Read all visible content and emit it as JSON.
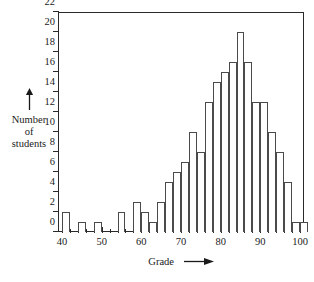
{
  "figure": {
    "y_axis": {
      "caption_lines": [
        "Number",
        "of",
        "students"
      ],
      "arrow_icon": "up-arrow-icon",
      "ticks": [
        0,
        2,
        4,
        6,
        8,
        10,
        12,
        14,
        16,
        18,
        20,
        22
      ],
      "min": 0,
      "max": 22
    },
    "x_axis": {
      "caption": "Grade",
      "arrow_icon": "right-arrow-icon",
      "ticks": [
        40,
        50,
        60,
        70,
        80,
        90,
        100
      ],
      "minor_step": 2,
      "min": 39,
      "max": 101
    }
  },
  "chart_data": {
    "type": "bar",
    "title": "",
    "xlabel": "Grade",
    "ylabel": "Number of students",
    "xlim": [
      39,
      101
    ],
    "ylim": [
      0,
      22
    ],
    "grid": false,
    "legend": null,
    "bin_width": 2,
    "categories": [
      "40",
      "42",
      "44",
      "46",
      "48",
      "50",
      "52",
      "54",
      "56",
      "58",
      "60",
      "62",
      "64",
      "66",
      "68",
      "70",
      "72",
      "74",
      "76",
      "78",
      "80",
      "82",
      "84",
      "86",
      "88",
      "90",
      "92",
      "94",
      "96",
      "98"
    ],
    "values": [
      2,
      0,
      1,
      0,
      1,
      0,
      0,
      2,
      0,
      3,
      2,
      1,
      3,
      5,
      6,
      7,
      10,
      8,
      13,
      15,
      16,
      17,
      20,
      17,
      13,
      13,
      10,
      8,
      5,
      1
    ],
    "extra_bar": {
      "category": "100",
      "value": 1
    }
  }
}
